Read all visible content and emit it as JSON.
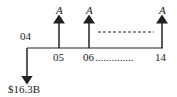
{
  "diagram": {
    "type": "cash-flow",
    "start_label": "04",
    "period_labels": [
      "05",
      "06",
      "14"
    ],
    "dots": "..............",
    "outflow_label": "$16.3B",
    "annuity_label": "A",
    "colors": {
      "line": "#222222",
      "text": "#222222"
    }
  }
}
